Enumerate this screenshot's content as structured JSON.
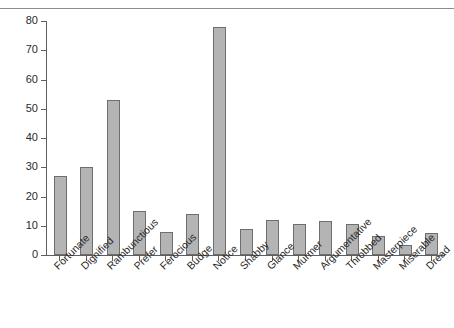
{
  "chart_data": {
    "type": "bar",
    "title": "",
    "subtitle": "",
    "xlabel": "",
    "ylabel": "",
    "grid": false,
    "legend": false,
    "ylim": [
      0,
      80
    ],
    "yticks": [
      0,
      10,
      20,
      30,
      40,
      50,
      60,
      70,
      80
    ],
    "ytick_labels": [
      "0",
      "10",
      "20",
      "30",
      "40",
      "50",
      "60",
      "70",
      "80"
    ],
    "categories": [
      "Fortunate",
      "Dignified",
      "Rambunctious",
      "Prefer",
      "Ferocious",
      "Budge",
      "Notice",
      "Shabby",
      "Glance",
      "Murmer",
      "Argumentative",
      "Throbbed",
      "Masterpiece",
      "Miserable",
      "Dread"
    ],
    "values": [
      27,
      30,
      53,
      15,
      8,
      14,
      78,
      9,
      12,
      10.5,
      11.5,
      10.5,
      6.5,
      3.5,
      7.5
    ]
  },
  "style": {
    "bar_fill": "#b4b4b4",
    "bar_stroke": "#6e6e6e",
    "axis_color": "#5e5e5e",
    "text_color": "#2b2b2b",
    "background": "#ffffff",
    "top_rule_color": "#8c8c8c"
  }
}
